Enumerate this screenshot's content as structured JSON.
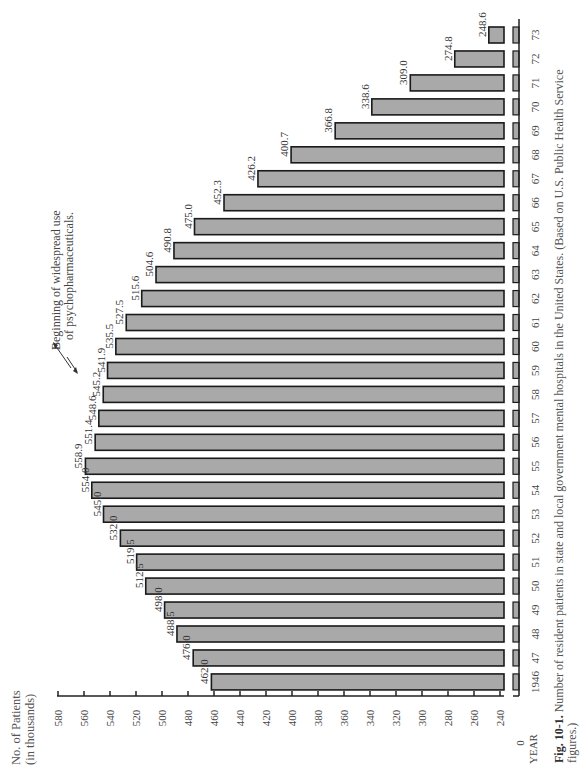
{
  "chart_data": {
    "type": "bar",
    "orientation": "rotated-90-ccw (years along vertical, values along horizontal)",
    "title": "",
    "xlabel": "YEAR",
    "ylabel": "No. of Patients (in thousands)",
    "ylabel_lines": [
      "No. of Patients",
      "(in thousands)"
    ],
    "ylim": [
      240,
      580
    ],
    "axis_break": true,
    "axis_zero_label": "0",
    "y_ticks": [
      580,
      560,
      540,
      520,
      500,
      480,
      460,
      440,
      420,
      400,
      380,
      360,
      340,
      320,
      300,
      280,
      260,
      240
    ],
    "categories": [
      "1946",
      "47",
      "48",
      "49",
      "50",
      "51",
      "52",
      "53",
      "54",
      "55",
      "56",
      "57",
      "58",
      "59",
      "60",
      "61",
      "62",
      "63",
      "64",
      "65",
      "66",
      "67",
      "68",
      "69",
      "70",
      "71",
      "72",
      "73"
    ],
    "values": [
      462.0,
      476.0,
      488.5,
      498.0,
      512.5,
      519.5,
      532.0,
      545.0,
      554.0,
      558.9,
      551.4,
      548.6,
      545.2,
      541.9,
      535.5,
      527.5,
      515.6,
      504.6,
      490.8,
      475.0,
      452.3,
      426.2,
      400.7,
      366.8,
      338.6,
      309.0,
      274.8,
      248.6
    ],
    "value_labels": [
      "462.0",
      "476.0",
      "488.5",
      "498.0",
      "512.5",
      "519.5",
      "532.0",
      "545.0",
      "554.0",
      "558.9",
      "551.4",
      "548.6",
      "545.2",
      "541.9",
      "535.5",
      "527.5",
      "515.6",
      "504.6",
      "490.8",
      "475.0",
      "452.3",
      "426.2",
      "400.7",
      "366.8",
      "338.6",
      "309.0",
      "274.8",
      "248.6"
    ],
    "annotations": [
      {
        "text_lines": [
          "Beginning of widespread use",
          "of psychopharmaceuticals."
        ],
        "points_to": [
          "55",
          "56"
        ]
      }
    ],
    "grid": false,
    "legend": null,
    "bar_color": "#a9a9a9"
  },
  "caption": {
    "label": "Fig. 10-1.",
    "text_line1": " Number of resident patients in state and local government mental hospitals in the United States. (Based on U.S. Public Health Service",
    "text_line2": "figures.)"
  }
}
